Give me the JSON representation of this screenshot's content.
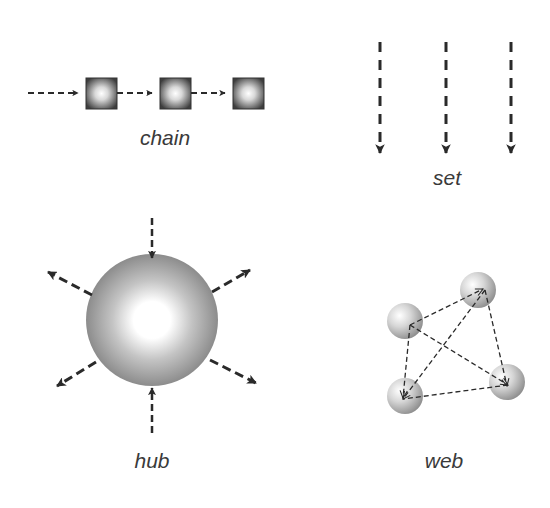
{
  "diagram": {
    "panels": [
      {
        "id": "chain",
        "label": "chain",
        "label_pos": {
          "x": 165,
          "y": 128
        }
      },
      {
        "id": "set",
        "label": "set",
        "label_pos": {
          "x": 447,
          "y": 168
        }
      },
      {
        "id": "hub",
        "label": "hub",
        "label_pos": {
          "x": 152,
          "y": 449
        }
      },
      {
        "id": "web",
        "label": "web",
        "label_pos": {
          "x": 444,
          "y": 449
        }
      }
    ],
    "colors": {
      "stroke": "#2a2a2a",
      "node_dark": "#4a4a4a",
      "node_light": "#ffffff",
      "sphere_edge": "#8a8a8a",
      "text": "#3a3a3a"
    }
  }
}
